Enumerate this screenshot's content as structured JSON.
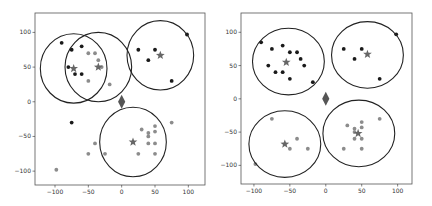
{
  "chart_data": [
    {
      "type": "scatter",
      "title": "",
      "xlabel": "",
      "ylabel": "",
      "xlim": [
        -130,
        125
      ],
      "ylim": [
        -120,
        128
      ],
      "xticks": [
        -100,
        -50,
        0,
        50,
        100
      ],
      "yticks": [
        100,
        50,
        0,
        -50,
        -100
      ],
      "xtick_labels": [
        "-100",
        "-50",
        "0",
        "50",
        "100"
      ],
      "ytick_labels": [
        "100",
        "50",
        "0",
        "-50",
        "-100"
      ],
      "grid": false,
      "legend": null,
      "box": {
        "x0": 35,
        "y0": 13,
        "x1": 205,
        "y1": 185
      },
      "series": [
        {
          "name": "cluster-A (black)",
          "color": "#1a1a1a",
          "marker": "circle",
          "points": [
            [
              -90,
              85
            ],
            [
              -75,
              75
            ],
            [
              -60,
              80
            ],
            [
              -80,
              50
            ],
            [
              -70,
              40
            ],
            [
              -60,
              40
            ],
            [
              25,
              75
            ],
            [
              50,
              75
            ],
            [
              40,
              60
            ],
            [
              98,
              97
            ],
            [
              75,
              30
            ],
            [
              -75,
              -30
            ]
          ]
        },
        {
          "name": "cluster-B (gray)",
          "color": "#8c8c8c",
          "marker": "circle",
          "points": [
            [
              -50,
              70
            ],
            [
              -40,
              70
            ],
            [
              -35,
              60
            ],
            [
              -30,
              50
            ],
            [
              -50,
              30
            ],
            [
              -18,
              25
            ],
            [
              30,
              -40
            ],
            [
              40,
              -45
            ],
            [
              40,
              -50
            ],
            [
              40,
              -60
            ],
            [
              50,
              -35
            ],
            [
              50,
              -43
            ],
            [
              50,
              -60
            ],
            [
              50,
              -75
            ],
            [
              25,
              -75
            ],
            [
              -40,
              -60
            ],
            [
              -50,
              -75
            ],
            [
              -25,
              -75
            ],
            [
              75,
              -30
            ],
            [
              -98,
              -98
            ]
          ]
        }
      ],
      "centroids": {
        "marker": "star",
        "color": "#666666",
        "points": [
          [
            -72,
            48
          ],
          [
            -35,
            50
          ],
          [
            58,
            67
          ],
          [
            17,
            -58
          ]
        ]
      },
      "circles": [
        {
          "cx": -72,
          "cy": 48,
          "r": 50
        },
        {
          "cx": -35,
          "cy": 50,
          "r": 50
        },
        {
          "cx": 58,
          "cy": 67,
          "r": 50
        },
        {
          "cx": 17,
          "cy": -58,
          "r": 50
        }
      ],
      "origin_marker": {
        "shape": "diamond",
        "x": 0,
        "y": 0,
        "color": "#555555"
      }
    },
    {
      "type": "scatter",
      "title": "",
      "xlabel": "",
      "ylabel": "",
      "xlim": [
        -118,
        120
      ],
      "ylim": [
        -128,
        129
      ],
      "xticks": [
        -100,
        -50,
        0,
        50,
        100
      ],
      "yticks": [
        100,
        50,
        0,
        -50,
        -100
      ],
      "xtick_labels": [
        "-100",
        "-50",
        "0",
        "50",
        "100"
      ],
      "ytick_labels": [
        "100",
        "50",
        "0",
        "-50",
        "-100"
      ],
      "grid": false,
      "legend": null,
      "box": {
        "x0": 241,
        "y0": 13,
        "x1": 412,
        "y1": 184
      },
      "series": [
        {
          "name": "cluster-A (black)",
          "color": "#1a1a1a",
          "marker": "circle",
          "points": [
            [
              -90,
              85
            ],
            [
              -75,
              75
            ],
            [
              -60,
              80
            ],
            [
              -50,
              70
            ],
            [
              -40,
              70
            ],
            [
              -35,
              60
            ],
            [
              -30,
              50
            ],
            [
              -80,
              50
            ],
            [
              -70,
              40
            ],
            [
              -60,
              40
            ],
            [
              -50,
              30
            ],
            [
              -18,
              25
            ],
            [
              25,
              75
            ],
            [
              50,
              75
            ],
            [
              40,
              60
            ],
            [
              98,
              97
            ],
            [
              75,
              30
            ]
          ]
        },
        {
          "name": "cluster-B (gray)",
          "color": "#8c8c8c",
          "marker": "circle",
          "points": [
            [
              -75,
              -30
            ],
            [
              -40,
              -60
            ],
            [
              -50,
              -75
            ],
            [
              -25,
              -75
            ],
            [
              -98,
              -98
            ],
            [
              30,
              -40
            ],
            [
              40,
              -45
            ],
            [
              40,
              -50
            ],
            [
              40,
              -60
            ],
            [
              50,
              -35
            ],
            [
              50,
              -43
            ],
            [
              50,
              -60
            ],
            [
              50,
              -75
            ],
            [
              25,
              -75
            ],
            [
              75,
              -30
            ]
          ]
        }
      ],
      "centroids": {
        "marker": "star",
        "color": "#666666",
        "points": [
          [
            -55,
            55
          ],
          [
            58,
            67
          ],
          [
            -57,
            -68
          ],
          [
            45,
            -52
          ]
        ]
      },
      "circles": [
        {
          "cx": -52,
          "cy": 56,
          "r": 50
        },
        {
          "cx": 58,
          "cy": 66,
          "r": 50
        },
        {
          "cx": -57,
          "cy": -68,
          "r": 50
        },
        {
          "cx": 46,
          "cy": -52,
          "r": 50
        }
      ],
      "origin_marker": {
        "shape": "diamond",
        "x": 0,
        "y": 0,
        "color": "#555555"
      }
    }
  ]
}
